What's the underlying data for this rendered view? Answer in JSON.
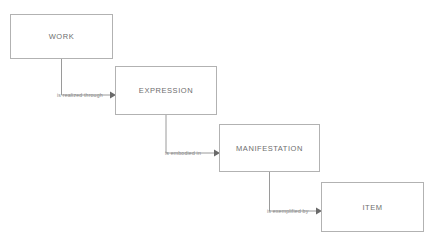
{
  "diagram": {
    "background_color": "#ffffff",
    "box_border_color": "#b2b2b2",
    "box_fill_color": "#ffffff",
    "entity_text_color": "#6e6e6e",
    "connector_color": "#9a9a9a",
    "relation_text_color": "#8a8a8a",
    "entities": [
      {
        "id": "work",
        "label": "WORK"
      },
      {
        "id": "expression",
        "label": "EXPRESSION"
      },
      {
        "id": "manifestation",
        "label": "MANIFESTATION"
      },
      {
        "id": "item",
        "label": "ITEM"
      }
    ],
    "relations": [
      {
        "id": "work-to-expression",
        "label": "is realized through",
        "from": "WORK",
        "to": "EXPRESSION"
      },
      {
        "id": "expression-to-manifestation",
        "label": "is embodied in",
        "from": "EXPRESSION",
        "to": "MANIFESTATION"
      },
      {
        "id": "manifestation-to-item",
        "label": "is exemplified by",
        "from": "MANIFESTATION",
        "to": "ITEM"
      }
    ]
  }
}
